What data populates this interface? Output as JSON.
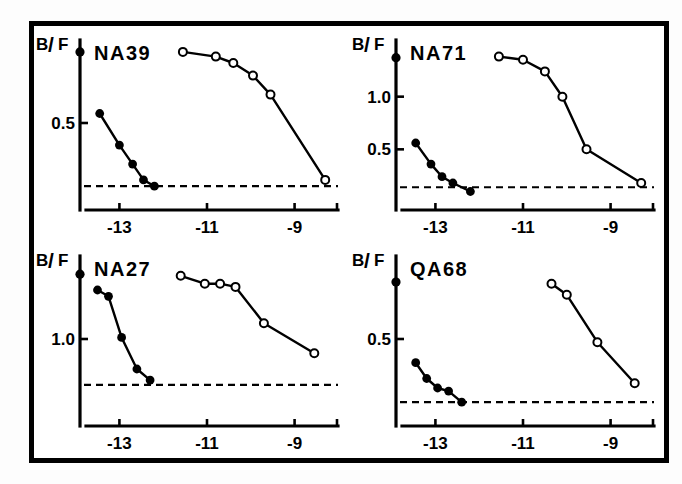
{
  "figure": {
    "panel_count": 4,
    "background": "#ffffff",
    "border_color": "#000000"
  },
  "chart_data": [
    {
      "type": "line",
      "title": "NA39",
      "xlabel": "",
      "ylabel": "B/F",
      "ylabel_parts": {
        "numerator": "B",
        "divider": "/",
        "denominator": "F"
      },
      "xlim": [
        -13.9,
        -8.1
      ],
      "ylim": [
        0.0,
        1.0
      ],
      "xticks": [
        -13,
        -11,
        -9
      ],
      "xticklabels": [
        "-13",
        "-11",
        "-9"
      ],
      "yticks": [
        0.5
      ],
      "yticklabels": [
        "0.5"
      ],
      "grid": false,
      "legend": "none",
      "baseline": {
        "value": 0.1,
        "style": "dashed",
        "label": ""
      },
      "axis_origin_marker": {
        "x": -13.9,
        "y": 0.95,
        "style": "filled"
      },
      "series": [
        {
          "name": "filled",
          "marker": "filled-circle",
          "x": [
            -13.45,
            -13.0,
            -12.7,
            -12.45,
            -12.2
          ],
          "y": [
            0.56,
            0.36,
            0.24,
            0.14,
            0.1
          ]
        },
        {
          "name": "open",
          "marker": "open-circle",
          "x": [
            -11.55,
            -10.8,
            -10.4,
            -9.95,
            -9.55,
            -8.3
          ],
          "y": [
            0.95,
            0.92,
            0.88,
            0.8,
            0.68,
            0.14
          ]
        }
      ]
    },
    {
      "type": "line",
      "title": "NA71",
      "xlabel": "",
      "ylabel": "B/F",
      "ylabel_parts": {
        "numerator": "B",
        "divider": "/",
        "denominator": "F"
      },
      "xlim": [
        -13.9,
        -8.1
      ],
      "ylim": [
        0.0,
        1.5
      ],
      "xticks": [
        -13,
        -11,
        -9
      ],
      "xticklabels": [
        "-13",
        "-11",
        "-9"
      ],
      "yticks": [
        1.0,
        0.5
      ],
      "yticklabels": [
        "1.0",
        "0.5"
      ],
      "grid": false,
      "legend": "none",
      "baseline": {
        "value": 0.14,
        "style": "dashed",
        "label": ""
      },
      "axis_origin_marker": {
        "x": -13.9,
        "y": 1.37,
        "style": "filled"
      },
      "series": [
        {
          "name": "filled",
          "marker": "filled-circle",
          "x": [
            -13.45,
            -13.1,
            -12.85,
            -12.6,
            -12.2
          ],
          "y": [
            0.56,
            0.36,
            0.24,
            0.18,
            0.1
          ]
        },
        {
          "name": "open",
          "marker": "open-circle",
          "x": [
            -11.55,
            -11.0,
            -10.5,
            -10.1,
            -9.55,
            -8.3
          ],
          "y": [
            1.38,
            1.35,
            1.24,
            1.0,
            0.5,
            0.18
          ]
        }
      ]
    },
    {
      "type": "line",
      "title": "NA27",
      "xlabel": "",
      "ylabel": "B/F",
      "ylabel_parts": {
        "numerator": "B",
        "divider": "/",
        "denominator": "F"
      },
      "xlim": [
        -13.9,
        -8.1
      ],
      "ylim": [
        0.0,
        2.0
      ],
      "xticks": [
        -13,
        -11,
        -9
      ],
      "xticklabels": [
        "-13",
        "-11",
        "-9"
      ],
      "yticks": [
        1.0
      ],
      "yticklabels": [
        "1.0"
      ],
      "grid": false,
      "legend": "none",
      "baseline": {
        "value": 0.42,
        "style": "dashed",
        "label": ""
      },
      "axis_origin_marker": {
        "x": -13.9,
        "y": 1.82,
        "style": "filled"
      },
      "series": [
        {
          "name": "filled",
          "marker": "filled-circle",
          "x": [
            -13.5,
            -13.25,
            -12.95,
            -12.6,
            -12.3
          ],
          "y": [
            1.62,
            1.54,
            1.02,
            0.62,
            0.48
          ]
        },
        {
          "name": "open",
          "marker": "open-circle",
          "x": [
            -11.6,
            -11.05,
            -10.7,
            -10.35,
            -9.7,
            -8.55
          ],
          "y": [
            1.8,
            1.7,
            1.7,
            1.66,
            1.2,
            0.82
          ]
        }
      ]
    },
    {
      "type": "line",
      "title": "QA68",
      "xlabel": "",
      "ylabel": "B/F",
      "ylabel_parts": {
        "numerator": "B",
        "divider": "/",
        "denominator": "F"
      },
      "xlim": [
        -13.9,
        -8.1
      ],
      "ylim": [
        0.0,
        1.0
      ],
      "xticks": [
        -13,
        -11,
        -9
      ],
      "xticklabels": [
        "-13",
        "-11",
        "-9"
      ],
      "yticks": [
        0.5
      ],
      "yticklabels": [
        "0.5"
      ],
      "grid": false,
      "legend": "none",
      "baseline": {
        "value": 0.1,
        "style": "dashed",
        "label": ""
      },
      "axis_origin_marker": {
        "x": -13.9,
        "y": 0.86,
        "style": "filled"
      },
      "series": [
        {
          "name": "filled",
          "marker": "filled-circle",
          "x": [
            -13.45,
            -13.2,
            -12.95,
            -12.7,
            -12.4
          ],
          "y": [
            0.35,
            0.25,
            0.19,
            0.17,
            0.1
          ]
        },
        {
          "name": "open",
          "marker": "open-circle",
          "x": [
            -10.35,
            -10.0,
            -9.3,
            -8.45
          ],
          "y": [
            0.85,
            0.78,
            0.48,
            0.22
          ]
        }
      ]
    }
  ]
}
